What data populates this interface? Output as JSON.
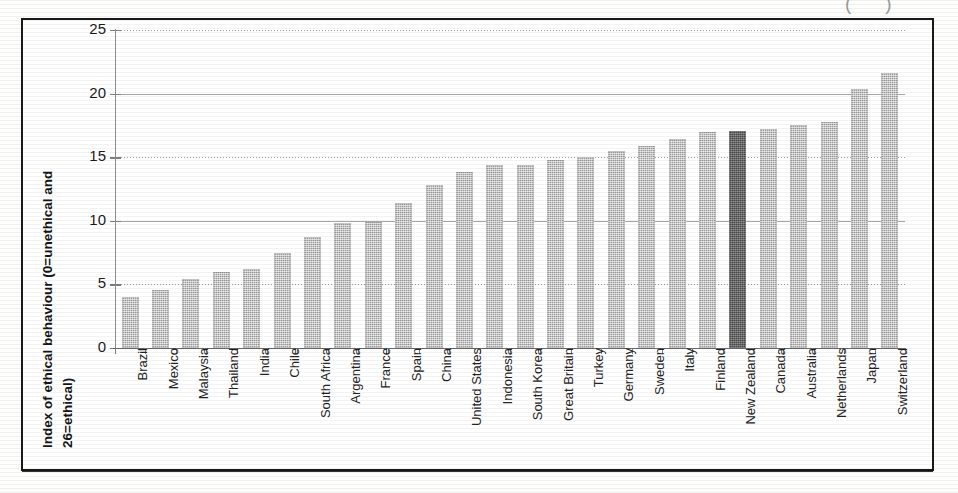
{
  "figure": {
    "top_fragment": "()",
    "y_axis_title_line1": "Index of ethical behaviour (0=unethical and",
    "y_axis_title_line2": "26=ethical)"
  },
  "chart_data": {
    "type": "bar",
    "title": "",
    "xlabel": "",
    "ylabel": "Index of ethical behaviour (0=unethical and 26=ethical)",
    "ylim": [
      0,
      25
    ],
    "yticks": [
      0,
      5,
      10,
      15,
      20,
      25
    ],
    "grid": true,
    "legend": "none",
    "highlight_category": "New Zealand",
    "highlight_color": "#4a4a4a",
    "bar_color": "#9d9d9d",
    "categories": [
      "Brazil",
      "Mexico",
      "Malaysia",
      "Thailand",
      "India",
      "Chile",
      "South Africa",
      "Argentina",
      "France",
      "Spain",
      "China",
      "United States",
      "Indonesia",
      "South Korea",
      "Great Britain",
      "Turkey",
      "Germany",
      "Sweden",
      "Italy",
      "Finland",
      "New Zealand",
      "Canada",
      "Australia",
      "Netherlands",
      "Japan",
      "Switzerland"
    ],
    "values": [
      4.0,
      4.6,
      5.4,
      6.0,
      6.2,
      7.5,
      8.7,
      9.8,
      9.9,
      11.4,
      12.8,
      13.8,
      14.4,
      14.4,
      14.8,
      15.0,
      15.5,
      15.9,
      16.4,
      17.0,
      17.1,
      17.2,
      17.5,
      17.8,
      20.4,
      21.6
    ]
  }
}
